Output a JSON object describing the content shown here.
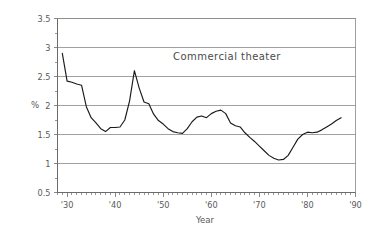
{
  "chart_data": {
    "type": "line",
    "title": "",
    "annotation": "Commercial theater",
    "xlabel": "Year",
    "ylabel": "%",
    "xlim": [
      1928.0,
      1990.0
    ],
    "ylim": [
      0.5,
      3.5
    ],
    "grid": true,
    "legend": null,
    "y_ticks": [
      0.5,
      1,
      1.5,
      2,
      2.5,
      3,
      3.5
    ],
    "y_tick_labels": [
      "0.5",
      "1",
      "1.5",
      "2",
      "2.5",
      "3",
      "3.5"
    ],
    "y_minor_step": 0.25,
    "x_ticks": [
      1930,
      1940,
      1950,
      1960,
      1970,
      1980,
      1990
    ],
    "x_tick_labels": [
      "'30",
      "'40",
      "'50",
      "'60",
      "'70",
      "'80",
      "'90"
    ],
    "x_minor_step": 1,
    "series": [
      {
        "name": "Commercial theater",
        "color": "#1a1a1a",
        "x": [
          1929,
          1930,
          1931,
          1932,
          1933,
          1934,
          1935,
          1936,
          1937,
          1938,
          1939,
          1940,
          1941,
          1942,
          1943,
          1944,
          1945,
          1946,
          1947,
          1948,
          1949,
          1950,
          1951,
          1952,
          1953,
          1954,
          1955,
          1956,
          1957,
          1958,
          1959,
          1960,
          1961,
          1962,
          1963,
          1964,
          1965,
          1966,
          1967,
          1968,
          1969,
          1970,
          1971,
          1972,
          1973,
          1974,
          1975,
          1976,
          1977,
          1978,
          1979,
          1980,
          1981,
          1982,
          1983,
          1984,
          1985,
          1986,
          1987
        ],
        "values": [
          2.9,
          2.42,
          2.4,
          2.37,
          2.35,
          1.98,
          1.79,
          1.7,
          1.6,
          1.55,
          1.62,
          1.62,
          1.63,
          1.75,
          2.08,
          2.6,
          2.3,
          2.06,
          2.03,
          1.85,
          1.74,
          1.68,
          1.6,
          1.55,
          1.53,
          1.52,
          1.6,
          1.72,
          1.8,
          1.82,
          1.79,
          1.86,
          1.9,
          1.92,
          1.86,
          1.7,
          1.65,
          1.63,
          1.53,
          1.45,
          1.38,
          1.3,
          1.22,
          1.14,
          1.09,
          1.06,
          1.07,
          1.14,
          1.28,
          1.42,
          1.5,
          1.54,
          1.53,
          1.54,
          1.58,
          1.63,
          1.68,
          1.74,
          1.79
        ]
      }
    ]
  }
}
